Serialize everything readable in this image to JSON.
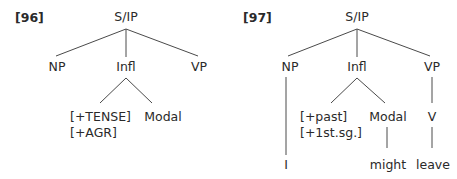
{
  "trees": [
    {
      "example_number": "[96]",
      "root": "S/IP",
      "children": [
        "NP",
        "Infl",
        "VP"
      ],
      "infl_children": {
        "features": [
          "[+TENSE]",
          "[+AGR]"
        ],
        "modal": "Modal"
      }
    },
    {
      "example_number": "[97]",
      "root": "S/IP",
      "children": [
        "NP",
        "Infl",
        "VP"
      ],
      "infl_children": {
        "features": [
          "[+past]",
          "[+1st.sg.]"
        ],
        "modal": "Modal"
      },
      "vp_child": "V",
      "leaves": {
        "np": "I",
        "modal": "might",
        "v": "leave"
      }
    }
  ],
  "colors": {
    "line": "#4a4a4a",
    "text": "#2a2a2a"
  }
}
